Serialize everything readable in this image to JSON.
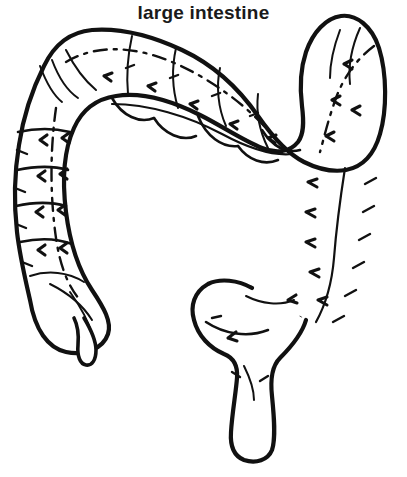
{
  "page": {
    "title": "large intestine",
    "background_color": "#ffffff",
    "ink_color": "#111111",
    "width": 407,
    "height": 477,
    "style": "black-and-white line-art coloring page"
  },
  "illustration": {
    "subject": "large intestine",
    "subject_label": "large intestine",
    "parts": [
      {
        "id": "hepatic-flexure",
        "label": "hepatic flexure",
        "description": "upper-left bend joining the ascending colon to the transverse colon"
      },
      {
        "id": "transverse-colon",
        "label": "transverse colon",
        "description": "wide horizontal segment sagging downward across the top of the figure"
      },
      {
        "id": "splenic-flexure",
        "label": "splenic flexure",
        "description": "upper-right bend joining the transverse colon to the descending colon"
      },
      {
        "id": "ascending-colon",
        "label": "ascending colon",
        "description": "vertical segment on the left side running upward from the cecum"
      },
      {
        "id": "descending-colon",
        "label": "descending colon",
        "description": "vertical segment on the right side running downward from the splenic flexure"
      },
      {
        "id": "cecum",
        "label": "cecum",
        "description": "rounded pouch at the lower end of the ascending colon"
      },
      {
        "id": "appendix",
        "label": "appendix",
        "description": "small hooked worm-shaped tube projecting from the bottom of the cecum"
      },
      {
        "id": "sigmoid-colon",
        "label": "sigmoid colon",
        "description": "S-shaped bulge curving left at the lower right"
      },
      {
        "id": "rectum",
        "label": "rectum",
        "description": "short vertical tube descending from the sigmoid colon to a rounded closed end"
      }
    ],
    "markings": {
      "haustra": "curved division lines separating the pouch-like haustra segments",
      "taenia_coli": "long dashed and solid lines running lengthwise along the colon",
      "tick_marks": "short arrow-like hatch marks along the walls"
    }
  }
}
